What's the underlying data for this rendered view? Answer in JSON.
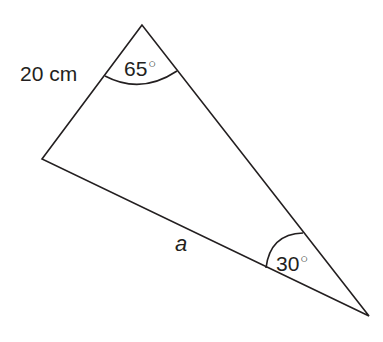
{
  "diagram": {
    "type": "triangle",
    "vertices": {
      "top": {
        "x": 142,
        "y": 25
      },
      "left": {
        "x": 42,
        "y": 159
      },
      "bottom_right": {
        "x": 369,
        "y": 316
      }
    },
    "stroke_color": "#231f20",
    "labels": {
      "side_top_left": "20 cm",
      "side_bottom": "a",
      "angle_top_value": "65",
      "angle_bottom_right_value": "30",
      "degree_symbol": "○"
    }
  }
}
